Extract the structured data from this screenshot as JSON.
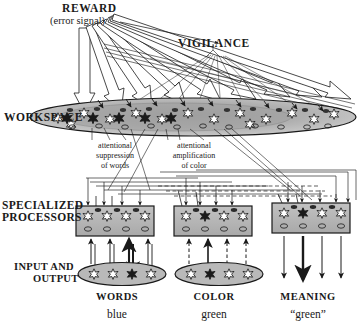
{
  "figure": {
    "background": "#ffffff",
    "ink": "#1a1a1a",
    "workspace_fill": "#b3b3b3",
    "processor_fill": "#b8b8b8",
    "active_neuron_fill": "#1a1a1a",
    "inactive_neuron_fill": "#ffffff"
  },
  "labels": {
    "reward": "REWARD",
    "reward_sub": "(error signal)",
    "vigilance": "VIGILANCE",
    "workspace": "WORKSPACE",
    "specialized_line1": "SPECIALIZED",
    "specialized_line2": "PROCESSORS",
    "input_output_line1": "INPUT AND",
    "input_output_line2": "OUTPUT"
  },
  "annotations": {
    "suppression": "attentional\nsuppression\nof words",
    "amplification": "attentional\namplification\nof color"
  },
  "columns": [
    {
      "name": "WORDS",
      "value": "blue",
      "id": "words",
      "active_index": 2,
      "arrow_style": "solid",
      "has_ellipse": true
    },
    {
      "name": "COLOR",
      "value": "green",
      "id": "color",
      "active_index": 1,
      "arrow_style": "dashed",
      "has_ellipse": true
    },
    {
      "name": "MEANING",
      "value": "“green”",
      "id": "meaning",
      "active_index": 1,
      "arrow_style": "solid",
      "has_ellipse": false
    }
  ],
  "processors": [
    {
      "id": "words-processor",
      "neurons": 4,
      "active_index": -1
    },
    {
      "id": "color-processor",
      "neurons": 4,
      "active_index": 1
    },
    {
      "id": "meaning-processor",
      "neurons": 4,
      "active_index": 1
    }
  ],
  "workspace": {
    "neuron_count": 14,
    "active_indices": [
      0,
      1,
      2,
      3,
      4
    ]
  }
}
